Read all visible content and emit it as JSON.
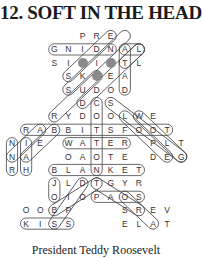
{
  "puzzle": {
    "title": "12. SOFT IN THE HEAD",
    "caption": "President Teddy Roosevelt",
    "grid_layout": {
      "x0": 12,
      "dx": 14.1,
      "y0": 36,
      "dy": 13.4
    },
    "rows": [
      {
        "row": 0,
        "cells": [
          [
            5,
            "P"
          ],
          [
            6,
            "R"
          ],
          [
            7,
            "E"
          ]
        ]
      },
      {
        "row": 1,
        "cells": [
          [
            3,
            "G"
          ],
          [
            4,
            "N"
          ],
          [
            5,
            "I"
          ],
          [
            6,
            "D"
          ],
          [
            7,
            "N"
          ],
          [
            8,
            "A"
          ],
          [
            9,
            "L"
          ]
        ]
      },
      {
        "row": 2,
        "cells": [
          [
            3,
            "S"
          ],
          [
            4,
            "I"
          ],
          [
            5,
            "●"
          ],
          [
            6,
            "I"
          ],
          [
            7,
            "●"
          ],
          [
            8,
            "T"
          ],
          [
            9,
            "L"
          ]
        ]
      },
      {
        "row": 3,
        "cells": [
          [
            4,
            "S"
          ],
          [
            5,
            "K"
          ],
          [
            6,
            "●"
          ],
          [
            7,
            "E"
          ],
          [
            8,
            "A"
          ]
        ]
      },
      {
        "row": 4,
        "cells": [
          [
            4,
            "S"
          ],
          [
            5,
            "U"
          ],
          [
            6,
            "D"
          ],
          [
            7,
            "O"
          ],
          [
            8,
            "D"
          ]
        ]
      },
      {
        "row": 5,
        "cells": [
          [
            5,
            "D"
          ],
          [
            6,
            "C"
          ],
          [
            7,
            "S"
          ]
        ]
      },
      {
        "row": 6,
        "cells": [
          [
            3,
            "R"
          ],
          [
            4,
            "Y"
          ],
          [
            5,
            "D"
          ],
          [
            6,
            "O"
          ],
          [
            7,
            "O"
          ],
          [
            8,
            "L"
          ],
          [
            9,
            "W"
          ],
          [
            10,
            "E"
          ]
        ]
      },
      {
        "row": 7,
        "cells": [
          [
            1,
            "R"
          ],
          [
            2,
            "A"
          ],
          [
            3,
            "B"
          ],
          [
            4,
            "B"
          ],
          [
            5,
            "I"
          ],
          [
            6,
            "T"
          ],
          [
            7,
            "S"
          ],
          [
            8,
            "F"
          ],
          [
            9,
            "O"
          ],
          [
            10,
            "O"
          ],
          [
            11,
            "T"
          ]
        ]
      },
      {
        "row": 8,
        "cells": [
          [
            0,
            "N"
          ],
          [
            1,
            "I"
          ],
          [
            2,
            "E"
          ],
          [
            4,
            "W"
          ],
          [
            5,
            "A"
          ],
          [
            6,
            "T"
          ],
          [
            7,
            "E"
          ],
          [
            8,
            "R"
          ],
          [
            10,
            "P"
          ],
          [
            11,
            "L"
          ],
          [
            12,
            "T"
          ]
        ]
      },
      {
        "row": 9,
        "cells": [
          [
            0,
            "N"
          ],
          [
            1,
            "A"
          ],
          [
            4,
            "O"
          ],
          [
            5,
            "A"
          ],
          [
            6,
            "O"
          ],
          [
            7,
            "T"
          ],
          [
            8,
            "E"
          ],
          [
            10,
            "D"
          ],
          [
            11,
            "E"
          ],
          [
            12,
            "G"
          ]
        ]
      },
      {
        "row": 10,
        "cells": [
          [
            0,
            "R"
          ],
          [
            1,
            "H"
          ],
          [
            3,
            "B"
          ],
          [
            4,
            "L"
          ],
          [
            5,
            "A"
          ],
          [
            6,
            "N"
          ],
          [
            7,
            "K"
          ],
          [
            8,
            "E"
          ],
          [
            9,
            "T"
          ]
        ]
      },
      {
        "row": 11,
        "cells": [
          [
            3,
            "J"
          ],
          [
            4,
            "L"
          ],
          [
            5,
            "D"
          ],
          [
            6,
            "T"
          ],
          [
            7,
            "G"
          ],
          [
            8,
            "Y"
          ],
          [
            9,
            "R"
          ]
        ]
      },
      {
        "row": 12,
        "cells": [
          [
            3,
            "O"
          ],
          [
            4,
            "I"
          ],
          [
            5,
            "O"
          ],
          [
            6,
            "P"
          ],
          [
            7,
            "A"
          ],
          [
            8,
            "O"
          ],
          [
            9,
            "S"
          ]
        ]
      },
      {
        "row": 13,
        "cells": [
          [
            1,
            "O"
          ],
          [
            2,
            "O"
          ],
          [
            3,
            "B"
          ],
          [
            4,
            "P"
          ],
          [
            8,
            "S"
          ],
          [
            9,
            "R"
          ],
          [
            10,
            "E"
          ],
          [
            11,
            "V"
          ]
        ]
      },
      {
        "row": 14,
        "cells": [
          [
            1,
            "K"
          ],
          [
            2,
            "I"
          ],
          [
            3,
            "S"
          ],
          [
            4,
            "S"
          ],
          [
            8,
            "E"
          ],
          [
            9,
            "L"
          ],
          [
            10,
            "A"
          ],
          [
            11,
            "T"
          ]
        ]
      }
    ],
    "circled_words": [
      {
        "word": "GNIDN",
        "from": [
          3,
          1
        ],
        "to": [
          7,
          1
        ]
      },
      {
        "word": "AL",
        "from": [
          8,
          1
        ],
        "to": [
          9,
          1
        ]
      },
      {
        "word": "RABBITSFOOT",
        "from": [
          1,
          7
        ],
        "to": [
          11,
          7
        ]
      },
      {
        "word": "WATER",
        "from": [
          4,
          8
        ],
        "to": [
          8,
          8
        ]
      },
      {
        "word": "BLANKET",
        "from": [
          3,
          10
        ],
        "to": [
          9,
          10
        ]
      },
      {
        "word": "PAOS",
        "from": [
          6,
          12
        ],
        "to": [
          9,
          12
        ]
      },
      {
        "word": "KISS",
        "from": [
          1,
          14
        ],
        "to": [
          4,
          14
        ]
      },
      {
        "word": "ATAD",
        "from": [
          8,
          1
        ],
        "to": [
          8,
          4
        ]
      },
      {
        "word": "TL",
        "from": [
          8,
          2
        ],
        "to": [
          9,
          1
        ]
      },
      {
        "word": "JO",
        "from": [
          3,
          11
        ],
        "to": [
          3,
          12
        ]
      },
      {
        "word": "IAH",
        "from": [
          1,
          8
        ],
        "to": [
          1,
          10
        ]
      },
      {
        "word": "NNR",
        "from": [
          0,
          8
        ],
        "to": [
          0,
          10
        ]
      },
      {
        "word": "COOTA",
        "from": [
          6,
          5
        ],
        "to": [
          6,
          10
        ]
      },
      {
        "word": "SKIDDLE",
        "from": [
          4,
          3
        ],
        "to": [
          7,
          0
        ]
      },
      {
        "word": "SUDOD",
        "from": [
          4,
          4
        ],
        "to": [
          8,
          0
        ]
      },
      {
        "word": "DIAGONAL1",
        "from": [
          5,
          5
        ],
        "to": [
          9,
          1
        ]
      },
      {
        "word": "RYD",
        "from": [
          3,
          6
        ],
        "to": [
          6,
          3
        ]
      },
      {
        "word": "WEPLT",
        "from": [
          9,
          6
        ],
        "to": [
          12,
          9
        ]
      },
      {
        "word": "SFOOT",
        "from": [
          7,
          5
        ],
        "to": [
          12,
          9
        ]
      },
      {
        "word": "DIAG2",
        "from": [
          8,
          6
        ],
        "to": [
          11,
          9
        ]
      },
      {
        "word": "TGOA",
        "from": [
          6,
          11
        ],
        "to": [
          9,
          13
        ]
      },
      {
        "word": "SRLA",
        "from": [
          8,
          12
        ],
        "to": [
          10,
          14
        ]
      },
      {
        "word": "SP",
        "from": [
          3,
          14
        ],
        "to": [
          5,
          11
        ]
      },
      {
        "word": "BP",
        "from": [
          3,
          13
        ],
        "to": [
          6,
          11
        ]
      },
      {
        "word": "IEA",
        "from": [
          2,
          7
        ],
        "to": [
          0,
          9
        ]
      },
      {
        "word": "ABA",
        "from": [
          3,
          7
        ],
        "to": [
          1,
          9
        ]
      }
    ]
  }
}
